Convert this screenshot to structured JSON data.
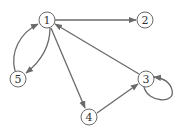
{
  "diagram": {
    "type": "directed-graph",
    "colors": {
      "edge": "#6a6a6a",
      "node_stroke": "#6a6a6a",
      "node_fill": "#ffffff",
      "label": "#333333"
    },
    "nodes": [
      {
        "id": "1",
        "label": "1"
      },
      {
        "id": "2",
        "label": "2"
      },
      {
        "id": "3",
        "label": "3"
      },
      {
        "id": "4",
        "label": "4"
      },
      {
        "id": "5",
        "label": "5"
      }
    ],
    "edges": [
      {
        "from": "1",
        "to": "2"
      },
      {
        "from": "1",
        "to": "5"
      },
      {
        "from": "5",
        "to": "1"
      },
      {
        "from": "1",
        "to": "4"
      },
      {
        "from": "4",
        "to": "3"
      },
      {
        "from": "3",
        "to": "1"
      },
      {
        "from": "3",
        "to": "3"
      }
    ]
  }
}
